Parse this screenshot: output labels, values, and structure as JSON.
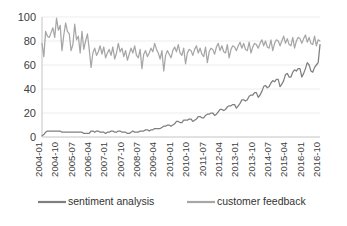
{
  "chart_data": {
    "type": "line",
    "title": "",
    "subtitle": "",
    "xlabel": "",
    "ylabel": "",
    "ylim": [
      0,
      100
    ],
    "yticks": [
      0,
      20,
      40,
      60,
      80,
      100
    ],
    "grid": true,
    "legend_position": "bottom",
    "x_tick_step_months": 9,
    "x_start": "2004-01",
    "x_end": "2016-10",
    "x_tick_labels": [
      "2004-01",
      "2004-10",
      "2005-07",
      "2006-04",
      "2007-01",
      "2007-10",
      "2008-07",
      "2009-04",
      "2010-01",
      "2010-10",
      "2011-07",
      "2012-04",
      "2013-01",
      "2013-10",
      "2014-07",
      "2015-04",
      "2016-01",
      "2016-10"
    ],
    "x": [
      "2004-01",
      "2004-02",
      "2004-03",
      "2004-04",
      "2004-05",
      "2004-06",
      "2004-07",
      "2004-08",
      "2004-09",
      "2004-10",
      "2004-11",
      "2004-12",
      "2005-01",
      "2005-02",
      "2005-03",
      "2005-04",
      "2005-05",
      "2005-06",
      "2005-07",
      "2005-08",
      "2005-09",
      "2005-10",
      "2005-11",
      "2005-12",
      "2006-01",
      "2006-02",
      "2006-03",
      "2006-04",
      "2006-05",
      "2006-06",
      "2006-07",
      "2006-08",
      "2006-09",
      "2006-10",
      "2006-11",
      "2006-12",
      "2007-01",
      "2007-02",
      "2007-03",
      "2007-04",
      "2007-05",
      "2007-06",
      "2007-07",
      "2007-08",
      "2007-09",
      "2007-10",
      "2007-11",
      "2007-12",
      "2008-01",
      "2008-02",
      "2008-03",
      "2008-04",
      "2008-05",
      "2008-06",
      "2008-07",
      "2008-08",
      "2008-09",
      "2008-10",
      "2008-11",
      "2008-12",
      "2009-01",
      "2009-02",
      "2009-03",
      "2009-04",
      "2009-05",
      "2009-06",
      "2009-07",
      "2009-08",
      "2009-09",
      "2009-10",
      "2009-11",
      "2009-12",
      "2010-01",
      "2010-02",
      "2010-03",
      "2010-04",
      "2010-05",
      "2010-06",
      "2010-07",
      "2010-08",
      "2010-09",
      "2010-10",
      "2010-11",
      "2010-12",
      "2011-01",
      "2011-02",
      "2011-03",
      "2011-04",
      "2011-05",
      "2011-06",
      "2011-07",
      "2011-08",
      "2011-09",
      "2011-10",
      "2011-11",
      "2011-12",
      "2012-01",
      "2012-02",
      "2012-03",
      "2012-04",
      "2012-05",
      "2012-06",
      "2012-07",
      "2012-08",
      "2012-09",
      "2012-10",
      "2012-11",
      "2012-12",
      "2013-01",
      "2013-02",
      "2013-03",
      "2013-04",
      "2013-05",
      "2013-06",
      "2013-07",
      "2013-08",
      "2013-09",
      "2013-10",
      "2013-11",
      "2013-12",
      "2014-01",
      "2014-02",
      "2014-03",
      "2014-04",
      "2014-05",
      "2014-06",
      "2014-07",
      "2014-08",
      "2014-09",
      "2014-10",
      "2014-11",
      "2014-12",
      "2015-01",
      "2015-02",
      "2015-03",
      "2015-04",
      "2015-05",
      "2015-06",
      "2015-07",
      "2015-08",
      "2015-09",
      "2015-10",
      "2015-11",
      "2015-12",
      "2016-01",
      "2016-02",
      "2016-03",
      "2016-04",
      "2016-05",
      "2016-06",
      "2016-07",
      "2016-08",
      "2016-09",
      "2016-10"
    ],
    "series": [
      {
        "name": "sentiment analysis",
        "color": "#7f7f7f",
        "values": [
          1,
          2,
          4,
          5,
          5,
          5,
          5,
          5,
          5,
          5,
          5,
          4,
          4,
          4,
          4,
          4,
          4,
          4,
          4,
          4,
          4,
          4,
          4,
          3,
          3,
          3,
          3,
          5,
          5,
          4,
          5,
          5,
          4,
          4,
          4,
          3,
          4,
          4,
          5,
          5,
          4,
          4,
          5,
          5,
          4,
          4,
          4,
          3,
          3,
          4,
          5,
          4,
          4,
          4,
          5,
          5,
          5,
          6,
          6,
          5,
          6,
          6,
          7,
          7,
          7,
          7,
          8,
          9,
          9,
          10,
          10,
          9,
          10,
          11,
          13,
          13,
          12,
          12,
          14,
          14,
          14,
          15,
          15,
          13,
          14,
          15,
          17,
          17,
          16,
          16,
          18,
          19,
          19,
          20,
          20,
          18,
          19,
          21,
          23,
          23,
          22,
          23,
          25,
          26,
          26,
          27,
          27,
          24,
          26,
          28,
          31,
          31,
          30,
          31,
          34,
          35,
          35,
          37,
          37,
          33,
          35,
          38,
          42,
          43,
          41,
          42,
          45,
          47,
          46,
          48,
          48,
          42,
          44,
          47,
          52,
          53,
          50,
          50,
          54,
          56,
          55,
          57,
          57,
          50,
          53,
          57,
          62,
          60,
          55,
          54,
          58,
          60,
          62,
          77
        ]
      },
      {
        "name": "customer feedback",
        "color": "#a6a6a6",
        "values": [
          78,
          67,
          88,
          84,
          83,
          87,
          91,
          83,
          99,
          89,
          93,
          72,
          85,
          95,
          88,
          86,
          72,
          77,
          94,
          81,
          84,
          70,
          88,
          73,
          80,
          86,
          73,
          58,
          70,
          74,
          68,
          71,
          76,
          69,
          75,
          66,
          70,
          73,
          68,
          75,
          65,
          70,
          78,
          71,
          74,
          67,
          72,
          64,
          69,
          74,
          70,
          76,
          68,
          66,
          73,
          57,
          69,
          72,
          67,
          70,
          74,
          71,
          78,
          73,
          70,
          65,
          72,
          55,
          68,
          72,
          69,
          66,
          72,
          75,
          71,
          77,
          70,
          68,
          74,
          61,
          70,
          73,
          72,
          68,
          73,
          76,
          70,
          74,
          69,
          67,
          75,
          62,
          71,
          74,
          73,
          69,
          75,
          78,
          72,
          76,
          71,
          70,
          77,
          66,
          73,
          76,
          75,
          72,
          76,
          79,
          74,
          78,
          73,
          72,
          79,
          70,
          75,
          78,
          77,
          74,
          78,
          81,
          76,
          80,
          75,
          74,
          81,
          72,
          78,
          81,
          80,
          76,
          80,
          84,
          78,
          82,
          77,
          76,
          83,
          74,
          80,
          83,
          82,
          78,
          82,
          85,
          79,
          83,
          78,
          77,
          84,
          76,
          81,
          80
        ]
      }
    ]
  },
  "legend": {
    "items": [
      {
        "label": "sentiment analysis",
        "color": "#7f7f7f"
      },
      {
        "label": "customer feedback",
        "color": "#a6a6a6"
      }
    ]
  }
}
